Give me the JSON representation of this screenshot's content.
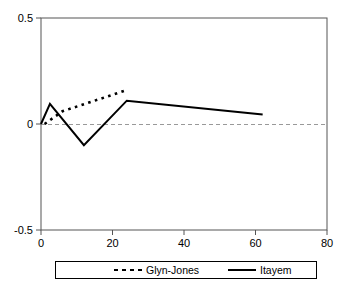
{
  "chart_data": {
    "type": "line",
    "title": "",
    "xlabel": "",
    "ylabel": "",
    "xlim": [
      0,
      80
    ],
    "ylim": [
      -0.5,
      0.5
    ],
    "grid": false,
    "zero_line": true,
    "legend_position": "bottom",
    "x_ticks": [
      0,
      20,
      40,
      60,
      80
    ],
    "x_tick_labels": [
      "0",
      "20",
      "40",
      "60",
      "80"
    ],
    "y_ticks": [
      -0.5,
      0,
      0.5
    ],
    "y_tick_labels": [
      "-0.5",
      "0",
      "0.5"
    ],
    "series": [
      {
        "name": "Glyn-Jones",
        "style": "dotted",
        "color": "#000000",
        "x": [
          1,
          6,
          24
        ],
        "values": [
          0.0,
          0.06,
          0.16
        ]
      },
      {
        "name": "Itayem",
        "style": "solid",
        "color": "#000000",
        "x": [
          0,
          2.5,
          12,
          24,
          62
        ],
        "values": [
          0.0,
          0.095,
          -0.1,
          0.11,
          0.045
        ]
      }
    ]
  },
  "axis": {
    "y_top_label": "0.5",
    "y_zero_label": "0",
    "y_bottom_label": "-0.5",
    "x_labels": [
      "0",
      "20",
      "40",
      "60",
      "80"
    ]
  },
  "legend": {
    "entries": [
      {
        "label": "Glyn-Jones",
        "style": "dashed"
      },
      {
        "label": "Itayem",
        "style": "solid"
      }
    ]
  }
}
